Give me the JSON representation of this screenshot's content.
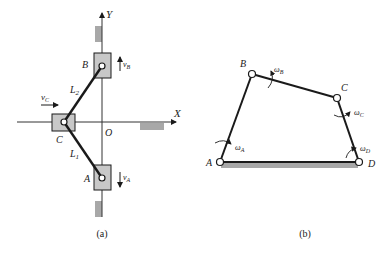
{
  "figure_a": {
    "caption": "(a)",
    "axes": {
      "x_label": "X",
      "y_label": "Y",
      "origin_label": "O"
    },
    "sliders": [
      {
        "name": "A",
        "label": "A",
        "velocity_label": "v",
        "velocity_sub": "A",
        "direction": "down"
      },
      {
        "name": "B",
        "label": "B",
        "velocity_label": "v",
        "velocity_sub": "B",
        "direction": "up"
      },
      {
        "name": "C",
        "label": "C",
        "velocity_label": "v",
        "velocity_sub": "C",
        "direction": "right"
      }
    ],
    "links": [
      {
        "label": "L",
        "sub": "1",
        "from": "C",
        "to": "A"
      },
      {
        "label": "L",
        "sub": "2",
        "from": "C",
        "to": "B"
      }
    ]
  },
  "figure_b": {
    "caption": "(b)",
    "joints": [
      {
        "label": "A",
        "omega": "ω",
        "omega_sub": "A"
      },
      {
        "label": "B",
        "omega": "ω",
        "omega_sub": "B"
      },
      {
        "label": "C",
        "omega": "ω",
        "omega_sub": "C"
      },
      {
        "label": "D",
        "omega": "ω",
        "omega_sub": "D"
      }
    ],
    "ground": "AD"
  },
  "colors": {
    "line": "#1a1a1a",
    "slider_fill": "#c8c8c8",
    "ground_fill": "#a8a8a8"
  }
}
